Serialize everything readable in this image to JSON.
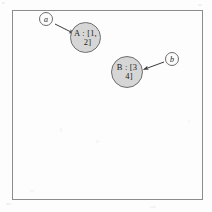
{
  "figure": {
    "frame": {
      "name": "diagram-frame",
      "border_color": "#8c8c8c",
      "background_color": "#fdfdfd"
    },
    "nodes": [
      {
        "id": "A",
        "label_line_1": "A : [1,",
        "label_line_2": "2]",
        "variable": "A",
        "value": "[1, 2]",
        "fill_color": "#d6d6d6",
        "stroke_color": "#6e6e6e",
        "center_x": 85,
        "center_y": 37,
        "diameter": 31
      },
      {
        "id": "B",
        "label_line_1": "B : [3",
        "label_line_2": "4]",
        "variable": "B",
        "value": "[3, 4]",
        "fill_color": "#d6d6d6",
        "stroke_color": "#6e6e6e",
        "center_x": 127,
        "center_y": 72,
        "diameter": 32
      }
    ],
    "callouts": [
      {
        "id": "a",
        "label": "a",
        "center_x": 46,
        "center_y": 19,
        "diameter": 14,
        "points_to": "A"
      },
      {
        "id": "b",
        "label": "b",
        "center_x": 172,
        "center_y": 59,
        "diameter": 14,
        "points_to": "B"
      }
    ],
    "arrows": [
      {
        "name": "arrow-a-to-node-a",
        "from": "a",
        "to": "A",
        "x1": 55,
        "y1": 24,
        "x2": 75,
        "y2": 34,
        "color": "#3a3a3a"
      },
      {
        "name": "arrow-b-to-node-b",
        "from": "b",
        "to": "B",
        "x1": 164,
        "y1": 62,
        "x2": 142,
        "y2": 70,
        "color": "#3a3a3a"
      }
    ]
  }
}
